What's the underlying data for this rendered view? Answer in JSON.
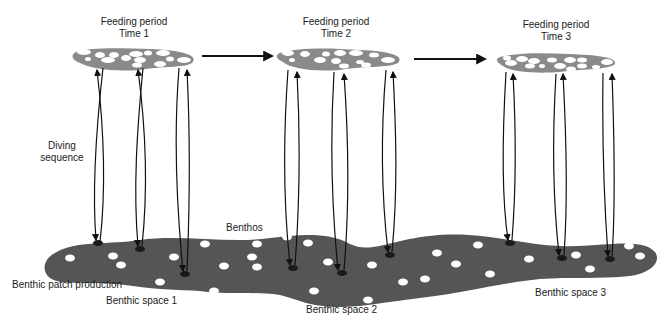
{
  "colors": {
    "patch": "#555555",
    "surface_patch": "#8a8a8a",
    "prey": "#ffffff",
    "arrow": "#111111",
    "hole": "#1a1a1a"
  },
  "feeding_periods": [
    {
      "title": "Feeding period",
      "time": "Time 1"
    },
    {
      "title": "Feeding period",
      "time": "Time 2"
    },
    {
      "title": "Feeding period",
      "time": "Time 3"
    }
  ],
  "labels": {
    "diving_sequence_line1": "Diving",
    "diving_sequence_line2": "sequence",
    "benthos": "Benthos",
    "benthic_patch_production": "Benthic patch production",
    "benthic_space_1": "Benthic space 1",
    "benthic_space_2": "Benthic space 2",
    "benthic_space_3": "Benthic space 3"
  }
}
